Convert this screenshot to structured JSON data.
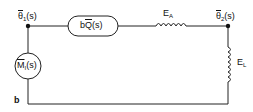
{
  "diagram": {
    "type": "equivalent-circuit",
    "nodes": {
      "left": {
        "symbol": "θ",
        "subscript": "1",
        "arg": "(s)"
      },
      "right": {
        "symbol": "θ",
        "subscript": "2",
        "arg": "(s)"
      }
    },
    "source_block": {
      "prefix": "b",
      "symbol": "Q",
      "arg": "(s)"
    },
    "current_source": {
      "symbol": "M",
      "subscript": "I",
      "arg": "(s)"
    },
    "inductor_top": {
      "symbol": "E",
      "subscript": "A"
    },
    "inductor_right": {
      "symbol": "E",
      "subscript": "L"
    },
    "ground_label": "b",
    "colors": {
      "line": "#222222",
      "background": "#ffffff"
    }
  }
}
